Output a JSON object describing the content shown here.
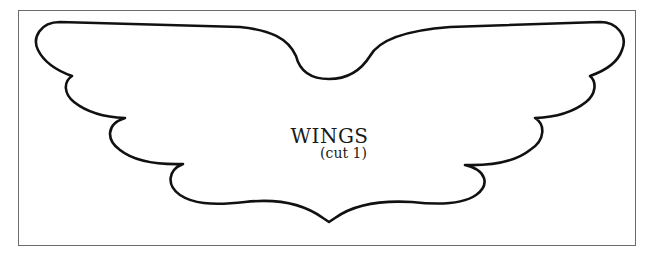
{
  "pattern": {
    "title": "WINGS",
    "subtitle": "(cut 1)",
    "line_color": "#111111",
    "border_color": "#6b6b6b"
  }
}
